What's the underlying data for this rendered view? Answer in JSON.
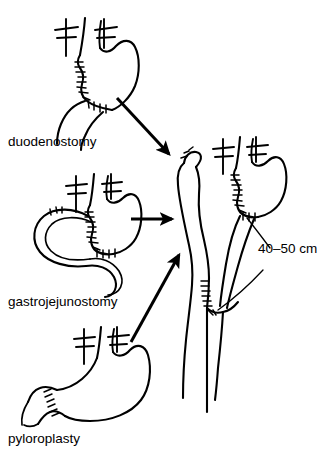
{
  "figure": {
    "background_color": "#ffffff",
    "ink_color": "#000000",
    "width": 328,
    "height": 459
  },
  "panels": [
    {
      "id": "duodenostomy",
      "label": "duodenostomy",
      "label_x": 8,
      "label_y": 146,
      "description": "Stomach with truncal vagotomy, sutured closure line and duodenal stump"
    },
    {
      "id": "gastrojejunostomy",
      "label": "gastrojejunostomy",
      "label_x": 8,
      "label_y": 306,
      "description": "Stomach with truncal vagotomy, sutured anastomosis to jejunal loop"
    },
    {
      "id": "pyloroplasty",
      "label": "pyloroplasty",
      "label_x": 8,
      "label_y": 443,
      "description": "Stomach with truncal vagotomy and transversely sutured pyloroplasty"
    }
  ],
  "result": {
    "id": "roux-en-y",
    "measurement_label": "40–50 cm",
    "measurement_x": 258,
    "measurement_y": 253,
    "description": "Roux-en-Y reconstruction with gastric pouch, Roux limb and jejunojejunal anastomosis"
  },
  "arrows": [
    {
      "id": "arrow-duodenostomy-to-result",
      "from": "duodenostomy",
      "to": "roux-en-y",
      "direction": "down-right"
    },
    {
      "id": "arrow-gastrojejunostomy-to-result",
      "from": "gastrojejunostomy",
      "to": "roux-en-y",
      "direction": "right"
    },
    {
      "id": "arrow-pyloroplasty-to-result",
      "from": "pyloroplasty",
      "to": "roux-en-y",
      "direction": "up-right"
    }
  ],
  "vagotomy_markers": [
    {
      "panel": "duodenostomy",
      "count": 2
    },
    {
      "panel": "gastrojejunostomy",
      "count": 2
    },
    {
      "panel": "pyloroplasty",
      "count": 2
    },
    {
      "panel": "roux-en-y",
      "count": 2
    }
  ]
}
